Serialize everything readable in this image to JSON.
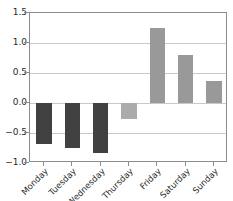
{
  "chart_data": {
    "type": "bar",
    "title": "",
    "xlabel": "",
    "ylabel": "",
    "categories": [
      "Monday",
      "Tuesday",
      "Wednesday",
      "Thursday",
      "Friday",
      "Saturday",
      "Sunday"
    ],
    "values": [
      -0.68,
      -0.75,
      -0.83,
      -0.27,
      1.25,
      0.8,
      0.36
    ],
    "bar_colors": [
      "#414141",
      "#414141",
      "#414141",
      "#ababab",
      "#999999",
      "#999999",
      "#999999"
    ],
    "ylim": [
      -1.0,
      1.5
    ],
    "yticks": [
      1.5,
      1.0,
      0.5,
      0.0,
      -0.5,
      -1.0
    ],
    "ytick_labels": [
      "1.5",
      "1.0",
      "0.5",
      "0.0",
      "−0.5",
      "−1.0"
    ],
    "grid": true,
    "grid_axis": "y",
    "legend": false,
    "legend_position": "none",
    "xtick_rotation": -45,
    "axis_color": "#8c8c8c",
    "grid_color": "#c9c9c9",
    "background_color": "#ffffff",
    "text_color": "#2b2b2b"
  }
}
